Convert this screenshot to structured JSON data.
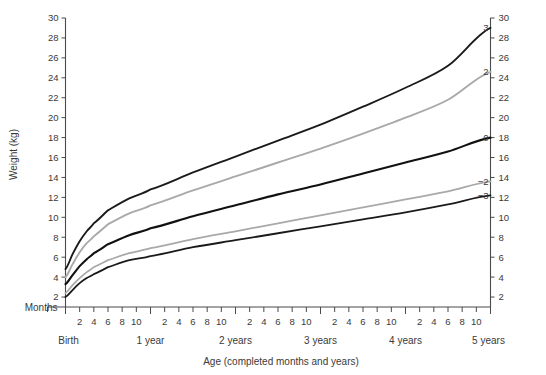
{
  "chart_data": {
    "type": "line",
    "title": "",
    "xlabel": "Age (completed months and years)",
    "ylabel": "Weight (kg)",
    "corner_label": "Months",
    "ylim": [
      1,
      30
    ],
    "yticks": [
      2,
      4,
      6,
      8,
      10,
      12,
      14,
      16,
      18,
      20,
      22,
      24,
      26,
      28,
      30
    ],
    "yticks_right": [
      2,
      4,
      6,
      8,
      10,
      12,
      14,
      16,
      18,
      20,
      22,
      24,
      26,
      28,
      30
    ],
    "grid": false,
    "legend_position": "right-inline-curve-labels",
    "xlim_months": [
      0,
      60
    ],
    "x_group_labels": [
      "Birth",
      "1 year",
      "2 years",
      "3 years",
      "4 years",
      "5 years"
    ],
    "x_group_label_months": [
      0,
      12,
      24,
      36,
      48,
      60
    ],
    "x_minor_tick_labels": [
      "2",
      "4",
      "6",
      "8",
      "10"
    ],
    "x_minor_tick_offsets_months": [
      2,
      4,
      6,
      8,
      10
    ],
    "x_tick_all_months": [
      0,
      2,
      4,
      6,
      8,
      10,
      12,
      14,
      16,
      18,
      20,
      22,
      24,
      26,
      28,
      30,
      32,
      34,
      36,
      38,
      40,
      42,
      44,
      46,
      48,
      50,
      52,
      54,
      56,
      58,
      60
    ],
    "series": [
      {
        "name": "3",
        "label": "3",
        "color": "#1a1a1a",
        "width": 1.9,
        "points_months": [
          0,
          1,
          2,
          3,
          4,
          6,
          9,
          12,
          18,
          24,
          30,
          36,
          42,
          48,
          54,
          60
        ],
        "values": [
          4.8,
          6.3,
          7.6,
          8.6,
          9.4,
          10.7,
          11.9,
          12.8,
          14.5,
          16.1,
          17.7,
          19.3,
          21.1,
          23.0,
          25.2,
          29.0
        ]
      },
      {
        "name": "2",
        "label": "2",
        "color": "#a9a9a9",
        "width": 1.9,
        "points_months": [
          0,
          1,
          2,
          3,
          4,
          6,
          9,
          12,
          18,
          24,
          30,
          36,
          42,
          48,
          54,
          60
        ],
        "values": [
          4.0,
          5.3,
          6.5,
          7.4,
          8.1,
          9.3,
          10.4,
          11.2,
          12.7,
          14.1,
          15.5,
          16.9,
          18.4,
          20.0,
          21.8,
          24.6
        ]
      },
      {
        "name": "0",
        "label": "0",
        "color": "#111111",
        "width": 2.1,
        "points_months": [
          0,
          1,
          2,
          3,
          4,
          6,
          9,
          12,
          18,
          24,
          30,
          36,
          42,
          48,
          54,
          60
        ],
        "values": [
          3.3,
          4.2,
          5.1,
          5.8,
          6.4,
          7.3,
          8.2,
          8.9,
          10.1,
          11.2,
          12.3,
          13.3,
          14.4,
          15.5,
          16.6,
          18.0
        ]
      },
      {
        "name": "-2",
        "label": "−2",
        "color": "#a9a9a9",
        "width": 1.8,
        "points_months": [
          0,
          1,
          2,
          3,
          4,
          6,
          9,
          12,
          18,
          24,
          30,
          36,
          42,
          48,
          54,
          60
        ],
        "values": [
          2.4,
          3.2,
          3.9,
          4.5,
          5.0,
          5.7,
          6.4,
          6.9,
          7.8,
          8.6,
          9.4,
          10.2,
          11.0,
          11.8,
          12.6,
          13.6
        ]
      },
      {
        "name": "-3",
        "label": "−3",
        "color": "#1a1a1a",
        "width": 1.8,
        "points_months": [
          0,
          1,
          2,
          3,
          4,
          6,
          9,
          12,
          18,
          24,
          30,
          36,
          42,
          48,
          54,
          60
        ],
        "values": [
          2.0,
          2.7,
          3.4,
          3.9,
          4.3,
          5.0,
          5.7,
          6.1,
          7.0,
          7.7,
          8.4,
          9.1,
          9.8,
          10.5,
          11.3,
          12.2
        ]
      }
    ]
  },
  "colors": {
    "axis": "#4a4a4a",
    "text": "#3a3a3a",
    "dark_curve": "#1a1a1a",
    "gray_curve": "#a9a9a9",
    "background": "#ffffff"
  }
}
